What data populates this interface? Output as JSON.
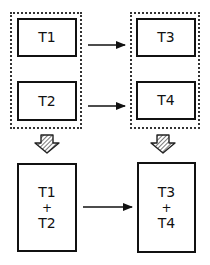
{
  "diagram": {
    "top_left_group": {
      "boxes": [
        {
          "label": "T1"
        },
        {
          "label": "T2"
        }
      ]
    },
    "top_right_group": {
      "boxes": [
        {
          "label": "T3"
        },
        {
          "label": "T4"
        }
      ]
    },
    "bottom_left_box": {
      "line1": "T1",
      "op": "+",
      "line2": "T2"
    },
    "bottom_right_box": {
      "line1": "T3",
      "op": "+",
      "line2": "T4"
    },
    "edges": [
      {
        "from": "T1",
        "to": "T3",
        "style": "solid-arrow"
      },
      {
        "from": "T2",
        "to": "T4",
        "style": "solid-arrow"
      },
      {
        "from": "left-group",
        "to": "T1+T2",
        "style": "hatched-block-arrow"
      },
      {
        "from": "right-group",
        "to": "T3+T4",
        "style": "hatched-block-arrow"
      },
      {
        "from": "T1+T2",
        "to": "T3+T4",
        "style": "solid-arrow"
      }
    ],
    "colors": {
      "stroke": "#111111",
      "background": "#ffffff",
      "hatch": "#555555"
    }
  }
}
